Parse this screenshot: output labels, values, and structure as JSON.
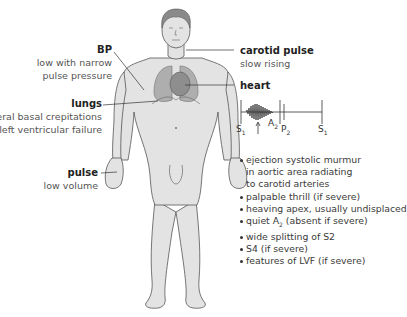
{
  "labels": {
    "bp": {
      "title": "BP",
      "lines": [
        "low with narrow",
        "pulse pressure"
      ]
    },
    "lungs": {
      "title": "lungs",
      "lines": [
        "bilateral basal crepitations",
        "due to left ventricular failure"
      ]
    },
    "pulse": {
      "title": "pulse",
      "lines": [
        "low volume"
      ]
    },
    "carotid": {
      "title": "carotid pulse",
      "lines": [
        "slow rising"
      ]
    },
    "heart": {
      "title": "heart"
    }
  },
  "phonocardiogram": {
    "s1_left": "S",
    "s1_left_sub": "1",
    "a2": "A",
    "a2_sub": "2",
    "p2": "P",
    "p2_sub": "2",
    "s1_right": "S",
    "s1_right_sub": "1"
  },
  "heart_features": [
    {
      "text": "ejection systolic murmur",
      "cont": [
        "in aortic area radiating",
        "to carotid arteries"
      ]
    },
    {
      "text": "palpable thrill (if severe)"
    },
    {
      "text": "heaving apex, usually undisplaced"
    },
    {
      "text_pre": "quiet A",
      "text_sub": "2",
      "text_post": " (absent if severe)"
    },
    {
      "text": "wide splitting of S2"
    },
    {
      "text": "S4 (if severe)"
    },
    {
      "text": "features of LVF (if severe)"
    }
  ],
  "colors": {
    "body_fill": "#e3e3e3",
    "body_stroke": "#555555",
    "hair": "#8a8a8a",
    "lungs": "#a9a9a9",
    "leader_line": "#333333"
  }
}
